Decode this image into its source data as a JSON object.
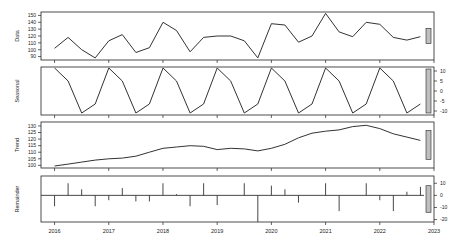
{
  "chart_data": {
    "type": "line",
    "title": "",
    "x": {
      "start": 2016.0,
      "end": 2022.75,
      "frequency": 4,
      "tick_labels": [
        "2016",
        "2017",
        "2018",
        "2019",
        "2020",
        "2021",
        "2022",
        "2023"
      ],
      "tick_values": [
        2016,
        2017,
        2018,
        2019,
        2020,
        2021,
        2022,
        2023
      ],
      "xlim": [
        2015.75,
        2023.0
      ]
    },
    "panels": [
      {
        "name": "Data",
        "ylabel": "Data",
        "ylim": [
          85,
          155
        ],
        "ticks": [
          90,
          100,
          110,
          120,
          130,
          140,
          150
        ],
        "tick_side": "left",
        "show_tick_labels": true,
        "style": "line",
        "values": [
          102,
          118,
          100,
          88,
          113,
          122,
          96,
          103,
          140,
          128,
          97,
          118,
          120,
          120,
          113,
          88,
          138,
          136,
          111,
          120,
          153,
          126,
          119,
          140,
          137,
          118,
          114,
          119
        ]
      },
      {
        "name": "Seasonal",
        "ylabel": "Seasonal",
        "ylim": [
          -12,
          12
        ],
        "ticks": [
          -10,
          -5,
          0,
          5,
          10
        ],
        "tick_side": "right",
        "show_tick_labels": true,
        "style": "line",
        "values": [
          11.5,
          5,
          -11,
          -6.5,
          11.5,
          5,
          -11,
          -6.5,
          11.5,
          5,
          -11,
          -6.5,
          11.5,
          5,
          -11,
          -6.5,
          11.5,
          5,
          -11,
          -6.5,
          11.5,
          5,
          -11,
          -6.5,
          11.5,
          5,
          -11,
          -6.5
        ]
      },
      {
        "name": "Trend",
        "ylabel": "Trend",
        "ylim": [
          98,
          133
        ],
        "ticks": [
          100,
          105,
          110,
          115,
          120,
          125,
          130
        ],
        "tick_side": "left",
        "show_tick_labels": true,
        "style": "line",
        "values": [
          99.5,
          101,
          102.5,
          104,
          105,
          105.5,
          107,
          110,
          113,
          114,
          115,
          114.5,
          112,
          113,
          112.5,
          111,
          113,
          116,
          121,
          124.5,
          126,
          127,
          129.5,
          130.5,
          128,
          124,
          121.5,
          119
        ]
      },
      {
        "name": "Remainder",
        "ylabel": "Remainder",
        "ylim": [
          -22,
          16
        ],
        "ticks": [
          -20,
          -10,
          0,
          10
        ],
        "tick_side": "right",
        "show_tick_labels": true,
        "style": "bar",
        "baseline": 0,
        "values": [
          -9,
          10,
          5,
          -9,
          -4,
          6,
          -5,
          -5,
          10,
          1,
          -9,
          10,
          -8,
          0,
          10,
          -22,
          8,
          5,
          -6,
          0,
          10,
          -13,
          0,
          10,
          -4,
          -13,
          3,
          7
        ]
      }
    ],
    "range_bars": {
      "description": "grey scale bars on the right edge showing relative scale of each panel",
      "color": "#bfbfbf"
    }
  },
  "colors": {
    "line": "#333333",
    "axis": "#222222",
    "background": "#ffffff",
    "range_bar_fill": "#bfbfbf"
  }
}
